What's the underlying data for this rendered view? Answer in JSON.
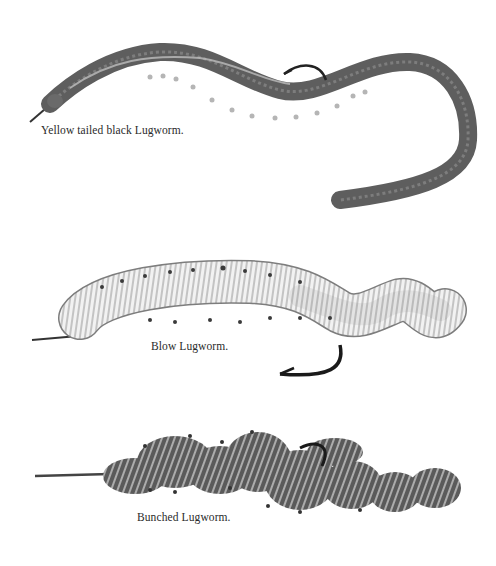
{
  "plate": {
    "background": "#ffffff",
    "illustrations": [
      {
        "id": "yellow-tailed",
        "caption": "Yellow tailed black Lugworm.",
        "body_color": "#6e6e6e",
        "hook_color": "#222222"
      },
      {
        "id": "blow",
        "caption": "Blow Lugworm.",
        "body_color": "#e8e8e8",
        "hook_color": "#1a1a1a"
      },
      {
        "id": "bunched",
        "caption": "Bunched Lugworm.",
        "body_color": "#555555",
        "hook_color": "#1a1a1a"
      }
    ]
  }
}
